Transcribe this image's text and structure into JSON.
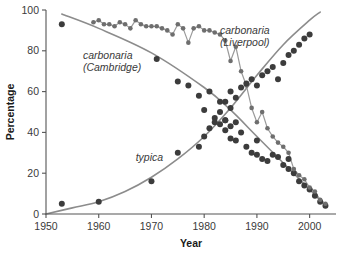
{
  "chart_data": {
    "type": "scatter",
    "title": "",
    "xlabel": "Year",
    "ylabel": "Percentage",
    "xlim": [
      1950,
      2005
    ],
    "ylim": [
      0,
      100
    ],
    "xticks": [
      1950,
      1960,
      1970,
      1980,
      1990,
      2000
    ],
    "yticks": [
      0,
      20,
      40,
      60,
      80,
      100
    ],
    "grid": false,
    "legend_position": "inline-annotations",
    "annotations": [
      {
        "id": "carbonaria-cambridge",
        "line1": "carbonaria",
        "line2": "(Cambridge)",
        "x": 1957,
        "y": 76
      },
      {
        "id": "carbonaria-liverpool",
        "line1": "carbonaria",
        "line2": "(Liverpool)",
        "x": 1983,
        "y": 88
      },
      {
        "id": "typica",
        "line1": "typica",
        "line2": "",
        "x": 1967,
        "y": 26
      }
    ],
    "series": [
      {
        "name": "carbonaria (Cambridge)",
        "style": "scatter+fit",
        "color": "#3c3c3c",
        "fit_color": "#8c8c8c",
        "points": [
          [
            1953,
            93.0
          ],
          [
            1971,
            76.0
          ],
          [
            1975,
            65.0
          ],
          [
            1977,
            63.0
          ],
          [
            1979,
            58.0
          ],
          [
            1980,
            51.0
          ],
          [
            1981,
            60.0
          ],
          [
            1982,
            47.0
          ],
          [
            1983,
            44.0
          ],
          [
            1983,
            55.0
          ],
          [
            1984,
            46.0
          ],
          [
            1984,
            41.0
          ],
          [
            1985,
            43.0
          ],
          [
            1985,
            37.0
          ],
          [
            1986,
            36.0
          ],
          [
            1986,
            45.0
          ],
          [
            1987,
            40.0
          ],
          [
            1988,
            33.0
          ],
          [
            1989,
            30.0
          ],
          [
            1990,
            29.0
          ],
          [
            1990,
            36.0
          ],
          [
            1991,
            27.0
          ],
          [
            1992,
            26.0
          ],
          [
            1993,
            29.0
          ],
          [
            1994,
            28.0
          ],
          [
            1995,
            24.0
          ],
          [
            1996,
            22.0
          ],
          [
            1996,
            27.0
          ],
          [
            1997,
            20.0
          ],
          [
            1998,
            16.0
          ],
          [
            1999,
            14.0
          ],
          [
            2000,
            12.0
          ],
          [
            2001,
            9.0
          ],
          [
            2002,
            6.0
          ],
          [
            2003,
            4.0
          ]
        ],
        "fit": [
          [
            1953,
            98.0
          ],
          [
            1960,
            91.0
          ],
          [
            1970,
            79.0
          ],
          [
            1980,
            62.0
          ],
          [
            1985,
            51.0
          ],
          [
            1990,
            38.0
          ],
          [
            1995,
            25.0
          ],
          [
            2000,
            12.0
          ],
          [
            2003,
            4.0
          ]
        ]
      },
      {
        "name": "carbonaria (Liverpool)",
        "style": "scatter+connected",
        "color": "#6e6e6e",
        "line_color": "#9a9a9a",
        "points": [
          [
            1959,
            94.0
          ],
          [
            1960,
            95.0
          ],
          [
            1961,
            93.0
          ],
          [
            1962,
            93.0
          ],
          [
            1963,
            92.0
          ],
          [
            1964,
            94.0
          ],
          [
            1965,
            93.0
          ],
          [
            1966,
            91.0
          ],
          [
            1967,
            95.0
          ],
          [
            1968,
            93.0
          ],
          [
            1969,
            92.0
          ],
          [
            1970,
            92.0
          ],
          [
            1971,
            92.0
          ],
          [
            1972,
            91.0
          ],
          [
            1973,
            90.0
          ],
          [
            1974,
            88.0
          ],
          [
            1975,
            93.0
          ],
          [
            1976,
            91.0
          ],
          [
            1977,
            84.0
          ],
          [
            1978,
            91.0
          ],
          [
            1979,
            92.0
          ],
          [
            1980,
            90.0
          ],
          [
            1981,
            90.0
          ],
          [
            1982,
            89.0
          ],
          [
            1983,
            88.0
          ],
          [
            1984,
            85.0
          ],
          [
            1985,
            75.0
          ],
          [
            1986,
            82.0
          ],
          [
            1987,
            70.0
          ],
          [
            1988,
            63.0
          ],
          [
            1989,
            52.0
          ],
          [
            1990,
            45.0
          ],
          [
            1991,
            50.0
          ],
          [
            1992,
            42.0
          ],
          [
            1993,
            38.0
          ],
          [
            1994,
            35.0
          ],
          [
            1995,
            33.0
          ],
          [
            1996,
            30.0
          ],
          [
            1997,
            22.0
          ],
          [
            1998,
            19.0
          ],
          [
            1999,
            17.0
          ],
          [
            2000,
            13.0
          ],
          [
            2001,
            11.0
          ],
          [
            2002,
            7.0
          ],
          [
            2003,
            5.0
          ]
        ]
      },
      {
        "name": "typica",
        "style": "scatter+fit",
        "color": "#3c3c3c",
        "fit_color": "#8c8c8c",
        "points": [
          [
            1953,
            5.0
          ],
          [
            1960,
            6.0
          ],
          [
            1970,
            16.0
          ],
          [
            1975,
            30.0
          ],
          [
            1979,
            33.0
          ],
          [
            1980,
            38.0
          ],
          [
            1981,
            42.0
          ],
          [
            1982,
            45.0
          ],
          [
            1983,
            50.0
          ],
          [
            1984,
            46.0
          ],
          [
            1984,
            55.0
          ],
          [
            1985,
            52.0
          ],
          [
            1985,
            60.0
          ],
          [
            1986,
            57.0
          ],
          [
            1987,
            62.0
          ],
          [
            1988,
            64.0
          ],
          [
            1989,
            66.0
          ],
          [
            1990,
            63.0
          ],
          [
            1991,
            68.0
          ],
          [
            1992,
            70.0
          ],
          [
            1993,
            72.0
          ],
          [
            1994,
            66.0
          ],
          [
            1995,
            74.0
          ],
          [
            1996,
            78.0
          ],
          [
            1997,
            80.0
          ],
          [
            1998,
            83.0
          ],
          [
            1999,
            86.0
          ],
          [
            2000,
            88.0
          ]
        ],
        "fit": [
          [
            1950,
            0.0
          ],
          [
            1955,
            3.0
          ],
          [
            1960,
            6.0
          ],
          [
            1965,
            11.0
          ],
          [
            1970,
            18.0
          ],
          [
            1975,
            27.0
          ],
          [
            1980,
            38.0
          ],
          [
            1985,
            52.0
          ],
          [
            1990,
            68.0
          ],
          [
            1995,
            83.0
          ],
          [
            2000,
            95.0
          ],
          [
            2002,
            99.0
          ]
        ]
      }
    ]
  }
}
